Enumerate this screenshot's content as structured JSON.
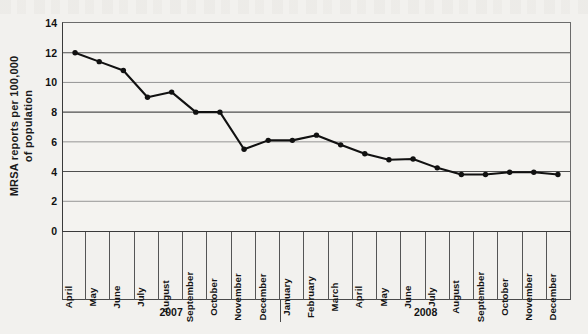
{
  "chart_data": {
    "type": "line",
    "title": "",
    "xlabel": "",
    "ylabel": "MRSA reports per 100,000 of population",
    "ylabel_lines": [
      "MRSA reports per 100,000",
      "of population"
    ],
    "ylim": [
      0,
      14
    ],
    "yticks": [
      14,
      12,
      10,
      8,
      6,
      4,
      2,
      0
    ],
    "grid": "horizontal",
    "legend": "none",
    "series_name": "MRSA reports per 100,000 of population",
    "line_color": "#111111",
    "marker": "filled-circle",
    "categories": [
      "April",
      "May",
      "June",
      "July",
      "August",
      "September",
      "October",
      "November",
      "December",
      "January",
      "February",
      "March",
      "April",
      "May",
      "June",
      "July",
      "August",
      "September",
      "October",
      "November",
      "December"
    ],
    "values": [
      12.0,
      11.4,
      10.8,
      9.0,
      9.35,
      8.0,
      8.0,
      5.5,
      6.1,
      6.1,
      6.45,
      5.8,
      5.2,
      4.8,
      4.85,
      4.25,
      3.8,
      3.8,
      3.95,
      3.95,
      3.8
    ],
    "groups": [
      {
        "label": "2007",
        "start_index": 0,
        "count": 9
      },
      {
        "label": "2008",
        "start_index": 9,
        "count": 12
      }
    ]
  }
}
